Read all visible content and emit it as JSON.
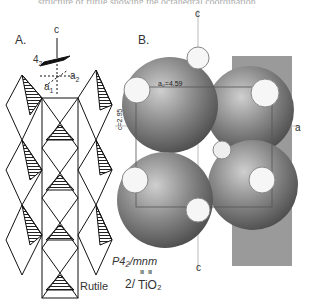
{
  "cut_off_text": "structure of rutile showing the octahedral coordination",
  "panel_a": {
    "label": "A.",
    "axis_c": "c",
    "axis_a1": "a",
    "axis_a1_sub": "1",
    "axis_a2": "a",
    "axis_a2_sub": "2",
    "screw_axis": "4",
    "screw_axis_sub": "2"
  },
  "panel_b": {
    "label": "B.",
    "axis_c_top": "c",
    "axis_c_bottom": "c",
    "axis_a": "a",
    "dim_a0": "a₀=4.59",
    "dim_c0": "c=2.95"
  },
  "caption": {
    "space_group": "P4₂/mnm",
    "mineral": "Rutile",
    "formula_prefix": "2/",
    "formula": "TiO₂",
    "formula_superscript": "Ⅲ Ⅲ"
  }
}
